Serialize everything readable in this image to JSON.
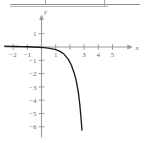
{
  "figure": {
    "title": "",
    "background_color": "#ffffff",
    "axis_color": "#9a9a9a",
    "curve_color": "#1a1a1a",
    "label_color": "#6a6a6a",
    "top_rule_color": "#8e8e8e"
  },
  "chart_data": {
    "type": "line",
    "title": "",
    "xlabel": "x",
    "ylabel": "y",
    "xlim": [
      -2.6,
      6.2
    ],
    "ylim": [
      -6.8,
      2.2
    ],
    "grid": false,
    "legend": null,
    "x_ticks": [
      -2,
      -1,
      1,
      2,
      3,
      4,
      5
    ],
    "x_tick_labels": [
      "-2",
      "-1",
      "1",
      "",
      "3",
      "4",
      "5"
    ],
    "y_ticks": [
      1,
      -1,
      -2,
      -3,
      -4,
      -5,
      -6
    ],
    "y_tick_labels": [
      "1",
      "-1",
      "-2",
      "-3",
      "-4",
      "-5",
      "-6"
    ],
    "series": [
      {
        "name": "curve",
        "x": [
          -2.6,
          -2.2,
          -1.8,
          -1.4,
          -1.0,
          -0.6,
          -0.2,
          0.2,
          0.6,
          1.0,
          1.3,
          1.6,
          1.9,
          2.1,
          2.3,
          2.45,
          2.6,
          2.7,
          2.78,
          2.85
        ],
        "y": [
          0.06,
          0.05,
          0.04,
          0.03,
          0.02,
          0.0,
          -0.02,
          -0.05,
          -0.1,
          -0.2,
          -0.33,
          -0.55,
          -0.95,
          -1.35,
          -1.95,
          -2.55,
          -3.45,
          -4.35,
          -5.3,
          -6.25
        ]
      }
    ],
    "annotations": [
      {
        "name": "x-axis-arrow",
        "at": [
          6.0,
          0
        ]
      },
      {
        "name": "y-axis-arrow",
        "at": [
          0,
          2.0
        ]
      }
    ]
  },
  "axis_labels": {
    "x": "x",
    "y": "y"
  }
}
